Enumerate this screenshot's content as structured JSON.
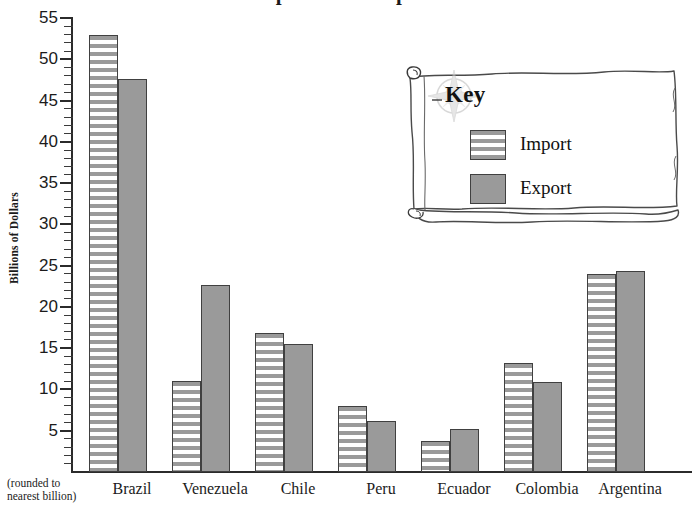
{
  "chart_data": {
    "type": "bar",
    "title": "Imports and Exports",
    "xlabel": "",
    "ylabel": "Billions of Dollars",
    "ylabel_note": "(rounded to nearest billion)",
    "ylim": [
      0,
      55
    ],
    "y_major_step": 5,
    "y_minor_step": 1,
    "grid": false,
    "legend_position": "top-right",
    "legend_title": "Key",
    "categories": [
      "Brazil",
      "Venezuela",
      "Chile",
      "Peru",
      "Ecuador",
      "Colombia",
      "Argentina"
    ],
    "series": [
      {
        "name": "Import",
        "style": "horizontal-stripes",
        "values": [
          53,
          11,
          16.8,
          8,
          3.8,
          13.2,
          24
        ]
      },
      {
        "name": "Export",
        "style": "solid-gray",
        "values": [
          47.6,
          22.7,
          15.5,
          6.2,
          5.2,
          10.9,
          24.3
        ]
      }
    ],
    "y_tick_labels": [
      "55",
      "50",
      "45",
      "40",
      "35",
      "30",
      "25",
      "20",
      "15",
      "10",
      "5"
    ],
    "colors": {
      "bar_fill_gray": "#9a9a9a",
      "bar_border": "#404040",
      "axis": "#2b2b2b",
      "text": "#1b1b1b",
      "background": "#ffffff",
      "parchment": "#ffffff",
      "parchment_outline": "#4a4a4a",
      "compass_rose": "#cfcfcf"
    }
  },
  "legend": {
    "title": "Key",
    "items": [
      {
        "label": "Import",
        "swatch": "striped"
      },
      {
        "label": "Export",
        "swatch": "solid"
      }
    ]
  }
}
